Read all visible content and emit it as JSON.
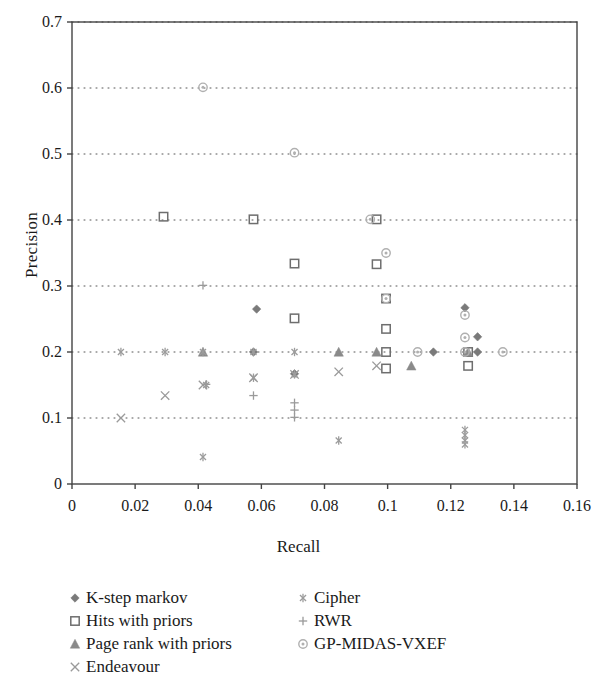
{
  "chart_data": {
    "type": "scatter",
    "title": "",
    "xlabel": "Recall",
    "ylabel": "Precision",
    "xlim": [
      0,
      0.16
    ],
    "ylim": [
      0,
      0.7
    ],
    "xticks": [
      "0",
      "0.02",
      "0.04",
      "0.06",
      "0.08",
      "0.1",
      "0.12",
      "0.14",
      "0.16"
    ],
    "xtick_values": [
      0,
      0.02,
      0.04,
      0.06,
      0.08,
      0.1,
      0.12,
      0.14,
      0.16
    ],
    "yticks": [
      "0",
      "0.1",
      "0.2",
      "0.3",
      "0.4",
      "0.5",
      "0.6",
      "0.7"
    ],
    "ytick_values": [
      0,
      0.1,
      0.2,
      0.3,
      0.4,
      0.5,
      0.6,
      0.7
    ],
    "grid": "horizontal-dotted",
    "legend_position": "below-plot",
    "series": [
      {
        "name": "K-step markov",
        "marker": "filled-diamond",
        "color": "#7a7a7a",
        "points": [
          [
            0.0575,
            0.2
          ],
          [
            0.0585,
            0.265
          ],
          [
            0.0705,
            0.167
          ],
          [
            0.1145,
            0.2
          ],
          [
            0.1245,
            0.267
          ],
          [
            0.1285,
            0.223
          ],
          [
            0.1285,
            0.2
          ]
        ]
      },
      {
        "name": "Hits with priors",
        "marker": "open-square",
        "color": "#6e6e6e",
        "points": [
          [
            0.029,
            0.405
          ],
          [
            0.0575,
            0.401
          ],
          [
            0.0705,
            0.334
          ],
          [
            0.0705,
            0.251
          ],
          [
            0.0965,
            0.401
          ],
          [
            0.0965,
            0.333
          ],
          [
            0.0995,
            0.281
          ],
          [
            0.0995,
            0.235
          ],
          [
            0.0995,
            0.2
          ],
          [
            0.0995,
            0.175
          ],
          [
            0.1255,
            0.2
          ],
          [
            0.1255,
            0.179
          ]
        ]
      },
      {
        "name": "Page rank with priors",
        "marker": "filled-triangle",
        "color": "#8a8a8a",
        "points": [
          [
            0.0415,
            0.2
          ],
          [
            0.0845,
            0.2
          ],
          [
            0.0965,
            0.2
          ],
          [
            0.1075,
            0.179
          ],
          [
            0.1255,
            0.2
          ]
        ]
      },
      {
        "name": "Endeavour",
        "marker": "x-cross",
        "color": "#9a9a9a",
        "points": [
          [
            0.0155,
            0.1
          ],
          [
            0.0295,
            0.134
          ],
          [
            0.0415,
            0.15
          ],
          [
            0.0575,
            0.161
          ],
          [
            0.0705,
            0.166
          ],
          [
            0.0845,
            0.17
          ],
          [
            0.0965,
            0.179
          ]
        ]
      },
      {
        "name": "Cipher",
        "marker": "asterisk",
        "color": "#9c9c9c",
        "points": [
          [
            0.0155,
            0.2
          ],
          [
            0.0295,
            0.2
          ],
          [
            0.0415,
            0.2
          ],
          [
            0.0415,
            0.041
          ],
          [
            0.0425,
            0.15
          ],
          [
            0.0575,
            0.2
          ],
          [
            0.0575,
            0.161
          ],
          [
            0.0705,
            0.2
          ],
          [
            0.0705,
            0.166
          ],
          [
            0.0845,
            0.066
          ],
          [
            0.1245,
            0.082
          ],
          [
            0.1245,
            0.074
          ],
          [
            0.1245,
            0.066
          ],
          [
            0.1245,
            0.06
          ]
        ]
      },
      {
        "name": "RWR",
        "marker": "plus",
        "color": "#9a9a9a",
        "points": [
          [
            0.0415,
            0.301
          ],
          [
            0.0575,
            0.134
          ],
          [
            0.0705,
            0.123
          ],
          [
            0.0705,
            0.112
          ],
          [
            0.0705,
            0.101
          ],
          [
            0.0425,
            0.151
          ]
        ]
      },
      {
        "name": "GP-MIDAS-VXEF",
        "marker": "circle-dot",
        "color": "#b0b0b0",
        "points": [
          [
            0.0415,
            0.601
          ],
          [
            0.0705,
            0.502
          ],
          [
            0.0945,
            0.401
          ],
          [
            0.0995,
            0.35
          ],
          [
            0.0995,
            0.281
          ],
          [
            0.1095,
            0.2
          ],
          [
            0.1245,
            0.256
          ],
          [
            0.1245,
            0.222
          ],
          [
            0.1245,
            0.2
          ],
          [
            0.1365,
            0.2
          ]
        ]
      }
    ]
  },
  "axis": {
    "ylabel_text": "Precision",
    "xlabel_text": "Recall"
  },
  "legend": {
    "left_column": [
      {
        "label": "K-step markov",
        "marker": "filled-diamond"
      },
      {
        "label": "Hits with priors",
        "marker": "open-square"
      },
      {
        "label": "Page rank with priors",
        "marker": "filled-triangle"
      },
      {
        "label": "Endeavour",
        "marker": "x-cross"
      }
    ],
    "right_column": [
      {
        "label": "Cipher",
        "marker": "asterisk"
      },
      {
        "label": "RWR",
        "marker": "plus"
      },
      {
        "label": "GP-MIDAS-VXEF",
        "marker": "circle-dot"
      }
    ]
  }
}
